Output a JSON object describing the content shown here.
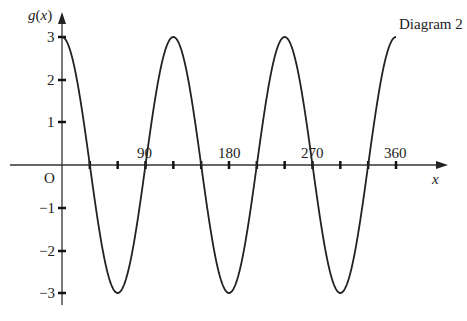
{
  "title": "Diagram 2",
  "chart_data": {
    "type": "line",
    "title": "Diagram 2",
    "xlabel": "x",
    "ylabel": "g(x)",
    "function": "g(x) = 3cos(3x)",
    "origin_label": "O",
    "x_ticks": [
      90,
      180,
      270,
      360
    ],
    "x_tick_labels": [
      "90",
      "180",
      "270",
      "360"
    ],
    "x_minor_ticks": [
      30,
      60,
      90,
      120,
      150,
      180,
      210,
      240,
      270,
      300,
      330,
      360
    ],
    "y_ticks": [
      3,
      2,
      1,
      -1,
      -2,
      -3
    ],
    "y_tick_labels": [
      "3",
      "2",
      "1",
      "−1",
      "−2",
      "−3"
    ],
    "xlim": [
      0,
      360
    ],
    "ylim": [
      -3,
      3
    ],
    "grid": false,
    "series": [
      {
        "name": "g(x)",
        "x": [
          0,
          30,
          60,
          90,
          120,
          150,
          180,
          210,
          240,
          270,
          300,
          330,
          360
        ],
        "values": [
          3,
          0,
          -3,
          0,
          3,
          0,
          -3,
          0,
          3,
          0,
          -3,
          0,
          3
        ]
      }
    ],
    "maxima": [
      [
        0,
        3
      ],
      [
        120,
        3
      ],
      [
        240,
        3
      ],
      [
        360,
        3
      ]
    ],
    "minima": [
      [
        60,
        -3
      ],
      [
        180,
        -3
      ],
      [
        300,
        -3
      ]
    ]
  },
  "labels": {
    "title": "Diagram 2",
    "y_axis": "g(x)",
    "x_axis": "x",
    "origin": "O",
    "x90": "90",
    "x180": "180",
    "x270": "270",
    "x360": "360",
    "y3": "3",
    "y2": "2",
    "y1": "1",
    "ym1": "−1",
    "ym2": "−2",
    "ym3": "−3"
  }
}
